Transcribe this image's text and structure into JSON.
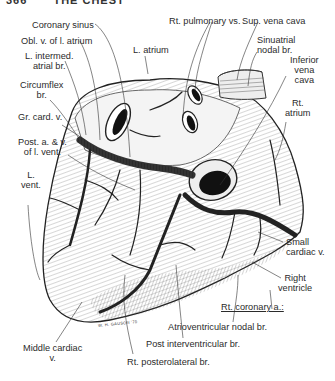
{
  "header": {
    "page_number": "366",
    "chapter_title": "THE CHEST"
  },
  "figure": {
    "artist_signature": "W. H. GAUSON '70"
  },
  "labels": {
    "coronary_sinus": "Coronary sinus",
    "obl_v_l_atrium": "Obl. v. of l. atrium",
    "l_intermed_atrial_br_1": "L. intermed.",
    "l_intermed_atrial_br_2": "atrial br.",
    "circumflex_br_1": "Circumflex",
    "circumflex_br_2": "br.",
    "gr_card_v": "Gr. card. v.",
    "post_a_v_1": "Post. a. & v.",
    "post_a_v_2": "of l. vent.",
    "l_vent_1": "L.",
    "l_vent_2": "vent.",
    "l_atrium": "L. atrium",
    "rt_pulmonary_vs": "Rt. pulmonary vs.",
    "sup_vena_cava": "Sup. vena cava",
    "sinuatrial_1": "Sinuatrial",
    "sinuatrial_2": "nodal br.",
    "ivc_1": "Inferior",
    "ivc_2": "vena",
    "ivc_3": "cava",
    "rt_atrium_1": "Rt.",
    "rt_atrium_2": "atrium",
    "small_cardiac_1": "Small",
    "small_cardiac_2": "cardiac v.",
    "right_ventricle_1": "Right",
    "right_ventricle_2": "ventricle",
    "rt_coronary_a": "Rt. coronary a.:",
    "av_nodal_br": "Atrioventricular nodal br.",
    "post_interventricular_br": "Post interventricular br.",
    "middle_cardiac_1": "Middle cardiac",
    "middle_cardiac_2": "v.",
    "rt_posterolateral_br": "Rt. posterolateral br."
  },
  "colors": {
    "ink": "#2a2a2a",
    "background": "#ffffff",
    "shade": "#8a8a8a"
  }
}
